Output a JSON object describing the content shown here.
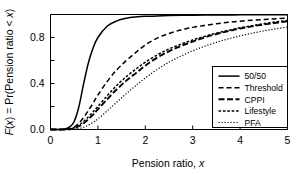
{
  "chart_data": {
    "type": "line",
    "title": "",
    "xlabel": "Pension ratio, x",
    "ylabel": "F(x) = Pr(Pension ratio < x)",
    "xlim": [
      0,
      5
    ],
    "ylim": [
      0,
      1.0
    ],
    "grid": false,
    "legend_position": "lower right",
    "xticks": [
      0,
      1,
      2,
      3,
      4,
      5
    ],
    "xtick_labels": [
      "0",
      "1",
      "2",
      "3",
      "4",
      "5"
    ],
    "yticks": [
      0.0,
      0.2,
      0.4,
      0.6,
      0.8,
      1.0
    ],
    "ytick_labels": [
      "0.0",
      "",
      "0.4",
      "",
      "0.8",
      ""
    ],
    "x": [
      0.0,
      0.1,
      0.2,
      0.3,
      0.4,
      0.5,
      0.6,
      0.7,
      0.8,
      0.9,
      1.0,
      1.2,
      1.4,
      1.6,
      1.8,
      2.0,
      2.25,
      2.5,
      2.75,
      3.0,
      3.25,
      3.5,
      3.75,
      4.0,
      4.25,
      4.5,
      4.75,
      5.0
    ],
    "series": [
      {
        "name": "50/50",
        "style": "solid",
        "color": "#000000",
        "values": [
          0.0,
          0.0,
          0.0,
          0.005,
          0.02,
          0.07,
          0.2,
          0.4,
          0.58,
          0.71,
          0.8,
          0.9,
          0.945,
          0.967,
          0.978,
          0.984,
          0.988,
          0.991,
          0.993,
          0.994,
          0.995,
          0.996,
          0.996,
          0.997,
          0.997,
          0.998,
          0.998,
          0.998
        ]
      },
      {
        "name": "Threshold",
        "style": "dashed",
        "color": "#000000",
        "values": [
          0.0,
          0.0,
          0.0,
          0.0,
          0.005,
          0.02,
          0.055,
          0.105,
          0.165,
          0.23,
          0.3,
          0.42,
          0.52,
          0.6,
          0.67,
          0.735,
          0.795,
          0.835,
          0.865,
          0.888,
          0.905,
          0.92,
          0.932,
          0.942,
          0.95,
          0.957,
          0.963,
          0.968
        ]
      },
      {
        "name": "CPPI",
        "style": "longdash",
        "color": "#000000",
        "values": [
          0.0,
          0.0,
          0.0,
          0.0,
          0.002,
          0.01,
          0.028,
          0.055,
          0.09,
          0.13,
          0.175,
          0.265,
          0.35,
          0.425,
          0.49,
          0.555,
          0.625,
          0.68,
          0.725,
          0.765,
          0.8,
          0.83,
          0.855,
          0.878,
          0.897,
          0.913,
          0.927,
          0.94
        ]
      },
      {
        "name": "Lifestyle",
        "style": "shortdash",
        "color": "#000000",
        "values": [
          0.0,
          0.0,
          0.0,
          0.0,
          0.004,
          0.015,
          0.038,
          0.07,
          0.11,
          0.155,
          0.2,
          0.295,
          0.385,
          0.46,
          0.525,
          0.585,
          0.648,
          0.7,
          0.742,
          0.778,
          0.81,
          0.838,
          0.862,
          0.884,
          0.903,
          0.92,
          0.935,
          0.948
        ]
      },
      {
        "name": "PFA",
        "style": "dotted",
        "color": "#000000",
        "values": [
          0.0,
          0.0,
          0.0,
          0.0,
          0.0,
          0.002,
          0.008,
          0.02,
          0.038,
          0.062,
          0.092,
          0.163,
          0.238,
          0.312,
          0.382,
          0.448,
          0.522,
          0.585,
          0.638,
          0.684,
          0.724,
          0.758,
          0.788,
          0.814,
          0.837,
          0.857,
          0.875,
          0.891
        ]
      }
    ]
  },
  "legend": {
    "items": [
      {
        "label": "50/50"
      },
      {
        "label": "Threshold"
      },
      {
        "label": "CPPI"
      },
      {
        "label": "Lifestyle"
      },
      {
        "label": "PFA"
      }
    ]
  },
  "axes": {
    "y_label_parts": {
      "f": "F",
      "paren_x": "(x)",
      "eq": " = Pr(Pension ratio < ",
      "x_end": "x",
      "close": ")"
    },
    "x_label_text": "Pension ratio, ",
    "x_label_italic": "x"
  }
}
